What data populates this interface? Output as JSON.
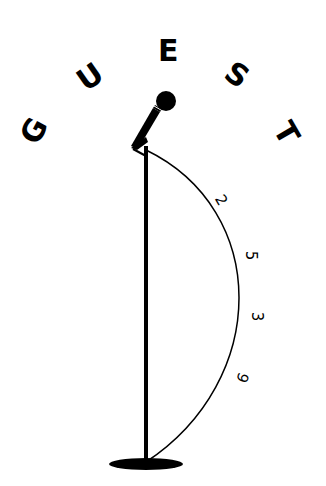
{
  "title_letters": [
    {
      "char": "G",
      "x": 22,
      "y": 116,
      "rotate": -62
    },
    {
      "char": "U",
      "x": 78,
      "y": 62,
      "rotate": -35
    },
    {
      "char": "E",
      "x": 158,
      "y": 36,
      "rotate": 0
    },
    {
      "char": "S",
      "x": 226,
      "y": 60,
      "rotate": 35
    },
    {
      "char": "T",
      "x": 276,
      "y": 118,
      "rotate": 60
    }
  ],
  "arc_digits": [
    {
      "char": "2",
      "x": 216,
      "y": 193,
      "rotate": 60
    },
    {
      "char": "5",
      "x": 246,
      "y": 248,
      "rotate": 90
    },
    {
      "char": "3",
      "x": 252,
      "y": 309,
      "rotate": 90
    },
    {
      "char": "9",
      "x": 237,
      "y": 370,
      "rotate": 110
    }
  ],
  "colors": {
    "ink": "#000000",
    "background": "#ffffff"
  }
}
